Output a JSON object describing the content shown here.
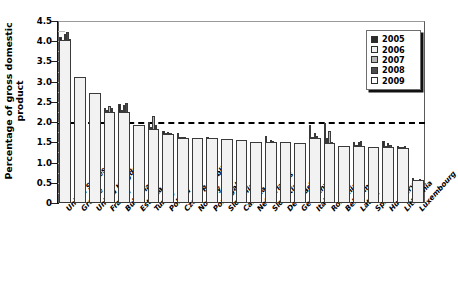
{
  "chart_data": {
    "type": "bar",
    "title": "",
    "subtitle": "",
    "xlabel": "",
    "ylabel": "Percentage of gross domestic product",
    "ylim": [
      0,
      4.5
    ],
    "ytick_labels": [
      "4.5",
      "4.0",
      "3.5",
      "3.0",
      "2.5",
      "2.0",
      "1.5",
      "1.0",
      "0.5",
      "0"
    ],
    "ytick_values": [
      4.5,
      4.0,
      3.5,
      3.0,
      2.5,
      2.0,
      1.5,
      1.0,
      0.5,
      0
    ],
    "grid": false,
    "legend_position": "top-right",
    "annotations": [
      {
        "type": "threshold-line",
        "value": 2.0,
        "style": "dashed",
        "color": "#000000",
        "label": ""
      }
    ],
    "categories": [
      "United States",
      "Greece",
      "United Kingdom",
      "France",
      "Bulgaria",
      "Estonia",
      "Turkey",
      "Poland",
      "Czech Republic",
      "Norway",
      "Portugal",
      "Slovenia",
      "Canada",
      "Netherlands",
      "Slovakia",
      "Denmark",
      "Germany",
      "Italy",
      "Romania",
      "Belgium",
      "Latvia",
      "Spain",
      "Hungary",
      "Lithuania",
      "Luxembourg"
    ],
    "series": [
      {
        "name": "2005",
        "color": "#2b2b2b",
        "values": [
          4.1,
          3.12,
          2.72,
          2.36,
          2.45,
          1.92,
          2.0,
          1.78,
          1.74,
          1.6,
          1.62,
          1.58,
          1.56,
          1.52,
          1.66,
          1.5,
          1.48,
          1.92,
          1.98,
          1.4,
          1.5,
          1.38,
          1.54,
          1.42,
          0.62
        ]
      },
      {
        "name": "2006",
        "color": "#f0f0f0",
        "values": [
          4.02,
          3.12,
          2.72,
          2.29,
          2.3,
          1.92,
          1.87,
          1.72,
          1.62,
          1.6,
          1.6,
          1.58,
          1.56,
          1.52,
          1.52,
          1.5,
          1.48,
          1.62,
          1.6,
          1.4,
          1.44,
          1.38,
          1.4,
          1.38,
          0.58
        ]
      },
      {
        "name": "2007",
        "color": "#b6b6b6",
        "values": [
          4.18,
          3.12,
          2.72,
          2.4,
          2.42,
          1.92,
          2.14,
          1.76,
          1.62,
          1.6,
          1.6,
          1.58,
          1.56,
          1.52,
          1.56,
          1.5,
          1.48,
          1.72,
          1.78,
          1.4,
          1.52,
          1.38,
          1.48,
          1.38,
          0.58
        ]
      },
      {
        "name": "2008",
        "color": "#4d4d4d",
        "values": [
          4.22,
          3.12,
          2.72,
          2.35,
          2.48,
          1.92,
          1.93,
          1.74,
          1.62,
          1.6,
          1.6,
          1.58,
          1.56,
          1.52,
          1.54,
          1.5,
          1.48,
          1.66,
          1.52,
          1.4,
          1.54,
          1.38,
          1.44,
          1.4,
          0.6
        ]
      },
      {
        "name": "2009",
        "color": "#ffffff",
        "values": [
          4.06,
          3.12,
          2.72,
          2.25,
          2.24,
          1.92,
          1.83,
          1.7,
          1.6,
          1.6,
          1.6,
          1.58,
          1.56,
          1.52,
          1.5,
          1.5,
          1.48,
          1.6,
          1.48,
          1.4,
          1.42,
          1.38,
          1.38,
          1.36,
          0.56
        ]
      }
    ]
  },
  "legend": {
    "items": [
      {
        "label": "2005",
        "color": "#2b2b2b"
      },
      {
        "label": "2006",
        "color": "#f0f0f0"
      },
      {
        "label": "2007",
        "color": "#b6b6b6"
      },
      {
        "label": "2008",
        "color": "#4d4d4d"
      },
      {
        "label": "2009",
        "color": "#ffffff"
      }
    ]
  }
}
